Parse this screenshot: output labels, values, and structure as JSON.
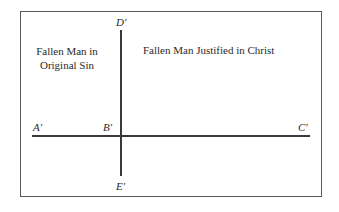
{
  "diagram": {
    "regions": {
      "left": {
        "label_line1": "Fallen Man in",
        "label_line2": "Original Sin"
      },
      "right": {
        "label": "Fallen Man Justified in Christ"
      }
    },
    "points": {
      "A": "A′",
      "B": "B′",
      "C": "C′",
      "D": "D′",
      "E": "E′"
    },
    "lines": [
      {
        "name": "horizontal",
        "from": "A′",
        "to": "C′",
        "through": "B′"
      },
      {
        "name": "vertical",
        "from": "D′",
        "to": "E′",
        "through": "B′"
      }
    ],
    "colors": {
      "frame": "#5a5a5a",
      "lines": "#3a3a3a",
      "text": "#2a2a2a",
      "background": "#ffffff"
    }
  }
}
